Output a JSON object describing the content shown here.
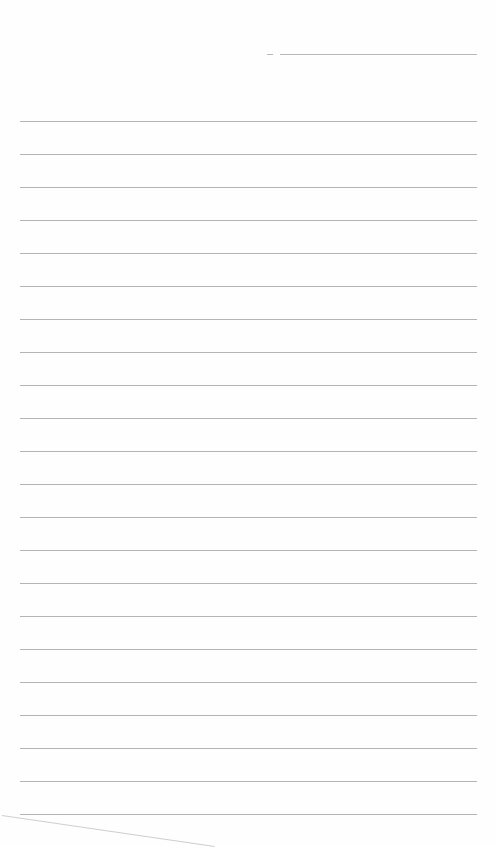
{
  "sheet": {
    "type": "lined-paper",
    "background_color": "#fefefe",
    "rule_color": "#b4b4b4",
    "header": {
      "short_line": {
        "x": 267,
        "width": 6
      },
      "long_line": {
        "x": 280,
        "width": 197
      }
    },
    "rules": {
      "count": 22,
      "first_y": 121,
      "spacing": 33,
      "left": 20,
      "width": 457
    }
  }
}
